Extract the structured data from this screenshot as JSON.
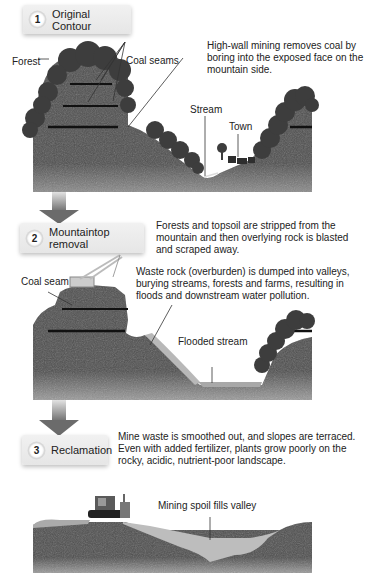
{
  "steps": [
    {
      "number": "1",
      "title": "Original Contour",
      "description": "High-wall mining removes coal by boring into the exposed face on the mountain side.",
      "labels": {
        "forest": "Forest",
        "coal_seams": "Coal seams",
        "stream": "Stream",
        "town": "Town"
      }
    },
    {
      "number": "2",
      "title": "Mountaintop removal",
      "description": "Forests and topsoil are stripped from the mountain and then overlying rock is blasted and scraped away.",
      "secondary_description": "Waste rock (overburden) is dumped into valleys, burying streams, forests and farms, resulting in floods and downstream water pollution.",
      "labels": {
        "coal_seam": "Coal seam",
        "flooded_stream": "Flooded stream"
      }
    },
    {
      "number": "3",
      "title": "Reclamation",
      "description": "Mine waste is smoothed out, and slopes are terraced. Even with added fertilizer, plants grow poorly on the rocky, acidic, nutrient-poor landscape.",
      "labels": {
        "mining_spoil": "Mining spoil fills valley"
      }
    }
  ],
  "colors": {
    "soil": "#4e4e4e",
    "soil_light": "#6a6a6a",
    "forest": "#3d3d3d",
    "spoil": "#bdbdbd",
    "arrow": "#6b6b6b",
    "box": "#ececec"
  }
}
